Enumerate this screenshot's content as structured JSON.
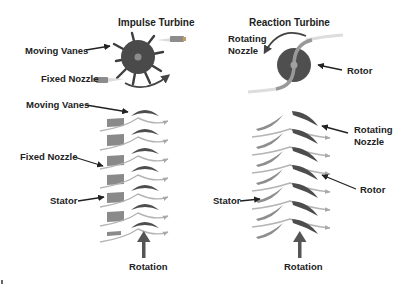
{
  "titles": {
    "impulse": "Impulse Turbine",
    "reaction": "Reaction Turbine"
  },
  "impulse_top": {
    "moving_vanes": "Moving Vanes",
    "fixed_nozzle": "Fixed Nozzle"
  },
  "reaction_top": {
    "rotating_nozzle_line1": "Rotating",
    "rotating_nozzle_line2": "Nozzle",
    "rotor": "Rotor"
  },
  "impulse_cascade": {
    "moving_vanes": "Moving Vanes",
    "fixed_nozzle": "Fixed Nozzle",
    "stator": "Stator",
    "rotation": "Rotation"
  },
  "reaction_cascade": {
    "rotating_nozzle_line1": "Rotating",
    "rotating_nozzle_line2": "Nozzle",
    "rotor": "Rotor",
    "stator": "Stator",
    "rotation": "Rotation"
  },
  "colors": {
    "rotor_dark": "#4a4a4a",
    "blade_dark": "#555555",
    "stator_grey": "#8a8a8a",
    "flow_line": "#b5b5b5",
    "arrow": "#333333",
    "text": "#222222"
  }
}
